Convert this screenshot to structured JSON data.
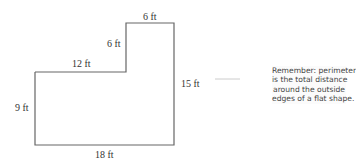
{
  "diagram": {
    "labels": {
      "top": "6 ft",
      "inner_vertical": "6 ft",
      "inner_horizontal": "12 ft",
      "right": "15 ft",
      "left": "9 ft",
      "bottom": "18 ft"
    },
    "callout": {
      "lines": [
        "Remember: perimeter",
        "is the total distance",
        "around the outside",
        "edges of a flat shape."
      ]
    },
    "colors": {
      "outline": "#666666",
      "text": "#333333",
      "connector": "#cccccc"
    }
  }
}
